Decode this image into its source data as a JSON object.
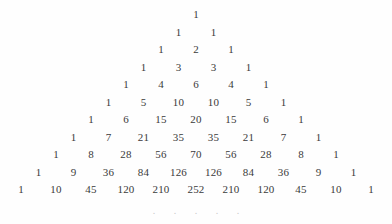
{
  "figure": {
    "background_color": "#fefefe",
    "text_color": "#3a3a3a",
    "ellipsis_color": "#c9c9c9"
  },
  "chart_data": {
    "type": "table",
    "xlabel": "",
    "ylabel": "",
    "layout": "centered-triangle",
    "row_count": 11,
    "row_spacing_px": 17.5,
    "cell_spacing_px": 35,
    "rows": [
      {
        "index": 0,
        "values": [
          "1"
        ]
      },
      {
        "index": 1,
        "values": [
          "1",
          "1"
        ]
      },
      {
        "index": 2,
        "values": [
          "1",
          "2",
          "1"
        ]
      },
      {
        "index": 3,
        "values": [
          "1",
          "3",
          "3",
          "1"
        ]
      },
      {
        "index": 4,
        "values": [
          "1",
          "4",
          "6",
          "4",
          "1"
        ]
      },
      {
        "index": 5,
        "values": [
          "1",
          "5",
          "10",
          "10",
          "5",
          "1"
        ]
      },
      {
        "index": 6,
        "values": [
          "1",
          "6",
          "15",
          "20",
          "15",
          "6",
          "1"
        ]
      },
      {
        "index": 7,
        "values": [
          "1",
          "7",
          "21",
          "35",
          "35",
          "21",
          "7",
          "1"
        ]
      },
      {
        "index": 8,
        "values": [
          "1",
          "8",
          "28",
          "56",
          "70",
          "56",
          "28",
          "8",
          "1"
        ]
      },
      {
        "index": 9,
        "values": [
          "1",
          "9",
          "36",
          "84",
          "126",
          "126",
          "84",
          "36",
          "9",
          "1"
        ]
      },
      {
        "index": 10,
        "values": [
          "1",
          "10",
          "45",
          "120",
          "210",
          "252",
          "210",
          "120",
          "45",
          "10",
          "1"
        ]
      }
    ],
    "continuation": {
      "glyph": ".",
      "count": 5,
      "label": "ellipsis-continuation"
    }
  }
}
